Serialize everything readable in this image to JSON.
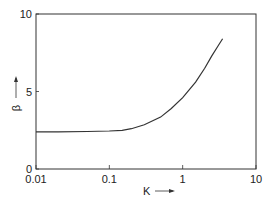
{
  "chart_data": {
    "type": "line",
    "title": "",
    "xlabel": "K",
    "ylabel": "β",
    "xscale": "log",
    "xlim": [
      0.01,
      10
    ],
    "ylim": [
      0,
      10
    ],
    "grid": false,
    "legend": null,
    "x_ticks": [
      "0.01",
      "0.1",
      "1",
      "10"
    ],
    "y_ticks": [
      "0",
      "5",
      "10"
    ],
    "series": [
      {
        "name": "β vs K",
        "x": [
          0.01,
          0.02,
          0.05,
          0.1,
          0.15,
          0.2,
          0.3,
          0.5,
          0.7,
          1.0,
          1.5,
          2.0,
          2.5,
          3.0,
          3.5
        ],
        "values": [
          2.4,
          2.4,
          2.42,
          2.45,
          2.5,
          2.6,
          2.85,
          3.35,
          3.9,
          4.6,
          5.6,
          6.5,
          7.3,
          7.9,
          8.4
        ]
      }
    ]
  }
}
